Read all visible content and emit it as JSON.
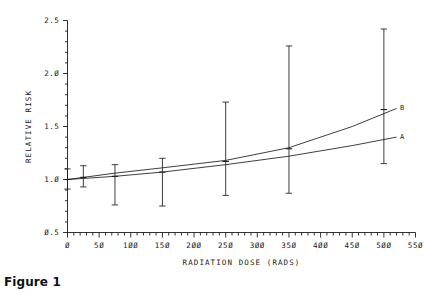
{
  "caption": "Figure 1",
  "chart_data": {
    "type": "scatter",
    "title": "",
    "xlabel": "RADIATION DOSE (RADS)",
    "ylabel": "RELATIVE RISK",
    "xlim": [
      0,
      550
    ],
    "ylim": [
      0.5,
      2.5
    ],
    "xticks": [
      0,
      50,
      100,
      150,
      200,
      250,
      300,
      350,
      400,
      450,
      500,
      550
    ],
    "xticklabels": [
      "Ø",
      "5Ø",
      "1ØØ",
      "15Ø",
      "2ØØ",
      "25Ø",
      "3ØØ",
      "35Ø",
      "4ØØ",
      "45Ø",
      "5ØØ",
      "55Ø"
    ],
    "xminor_interval": 10,
    "yticks": [
      0.5,
      1.0,
      1.5,
      2.0,
      2.5
    ],
    "yticklabels": [
      "Ø.5",
      "1.Ø",
      "1.5",
      "2.Ø",
      "2.5"
    ],
    "yminor_interval": 0.1,
    "grid": false,
    "legend_position": "inline-right",
    "points": [
      {
        "x": 0,
        "y": 1.0,
        "ylow": 0.91,
        "yhigh": 1.1
      },
      {
        "x": 25,
        "y": 1.02,
        "ylow": 0.93,
        "yhigh": 1.13
      },
      {
        "x": 75,
        "y": 1.03,
        "ylow": 0.76,
        "yhigh": 1.14
      },
      {
        "x": 150,
        "y": 1.07,
        "ylow": 0.75,
        "yhigh": 1.2
      },
      {
        "x": 250,
        "y": 1.17,
        "ylow": 0.85,
        "yhigh": 1.73
      },
      {
        "x": 350,
        "y": 1.29,
        "ylow": 0.87,
        "yhigh": 2.26
      },
      {
        "x": 500,
        "y": 1.66,
        "ylow": 1.15,
        "yhigh": 2.42
      }
    ],
    "series": [
      {
        "name": "A",
        "label": "A",
        "style": "line",
        "points": [
          {
            "x": 0,
            "y": 1.0
          },
          {
            "x": 25,
            "y": 1.01
          },
          {
            "x": 75,
            "y": 1.03
          },
          {
            "x": 150,
            "y": 1.07
          },
          {
            "x": 250,
            "y": 1.14
          },
          {
            "x": 350,
            "y": 1.22
          },
          {
            "x": 450,
            "y": 1.32
          },
          {
            "x": 520,
            "y": 1.4
          }
        ]
      },
      {
        "name": "B",
        "label": "B",
        "style": "line",
        "points": [
          {
            "x": 0,
            "y": 1.0
          },
          {
            "x": 25,
            "y": 1.02
          },
          {
            "x": 75,
            "y": 1.06
          },
          {
            "x": 150,
            "y": 1.11
          },
          {
            "x": 250,
            "y": 1.18
          },
          {
            "x": 350,
            "y": 1.3
          },
          {
            "x": 450,
            "y": 1.5
          },
          {
            "x": 520,
            "y": 1.67
          }
        ]
      }
    ]
  }
}
